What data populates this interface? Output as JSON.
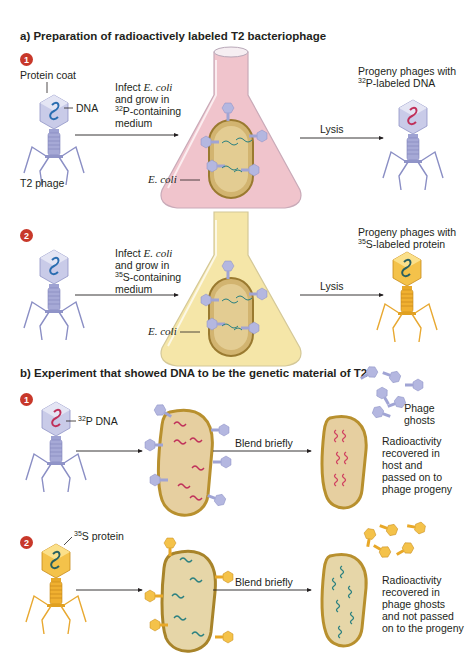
{
  "part_a": {
    "heading": "a) Preparation of radioactively labeled T2 bacteriophage",
    "step1": {
      "number": "1",
      "protein_coat_label": "Protein coat",
      "dna_label": "DNA",
      "phage_label": "T2 phage",
      "infect_line1_prefix": "Infect ",
      "infect_line1_species": "E. coli",
      "infect_line2": "and grow in",
      "infect_line3_isotope": "32",
      "infect_line3_rest": "P-containing",
      "infect_line4": "medium",
      "ecoli_label": "E. coli",
      "lysis_label": "Lysis",
      "progeny_line1": "Progeny phages with",
      "progeny_isotope": "32",
      "progeny_line2_rest": "P-labeled DNA",
      "medium_color": "#f0c4cc",
      "dna_color": "#c0305a"
    },
    "step2": {
      "number": "2",
      "infect_line1_prefix": "Infect ",
      "infect_line1_species": "E. coli",
      "infect_line2": "and grow in",
      "infect_line3_isotope": "35",
      "infect_line3_rest": "S-containing",
      "infect_line4": "medium",
      "ecoli_label": "E. coli",
      "lysis_label": "Lysis",
      "progeny_line1": "Progeny phages with",
      "progeny_isotope": "35",
      "progeny_line2_rest": "S-labeled protein",
      "medium_color": "#f5e6a8",
      "protein_color": "#f0b030"
    }
  },
  "part_b": {
    "heading": "b) Experiment that showed DNA to be the genetic material of T2",
    "step1": {
      "number": "1",
      "label_isotope": "32",
      "label_rest": "P DNA",
      "blend_label": "Blend briefly",
      "ghosts_line1": "Phage",
      "ghosts_line2": "ghosts",
      "result_lines": [
        "Radioactivity",
        "recovered in",
        "host and",
        "passed on to",
        "phage progeny"
      ]
    },
    "step2": {
      "number": "2",
      "label_isotope": "35",
      "label_rest": "S protein",
      "blend_label": "Blend briefly",
      "result_lines": [
        "Radioactivity",
        "recovered in",
        "phage ghosts",
        "and not passed",
        "on to the progeny"
      ]
    }
  },
  "colors": {
    "step_badge": "#c8382a",
    "phage_blue": "#a6a9d6",
    "phage_gold": "#f0b030",
    "cell_fill": "#e6cfa0",
    "cell_border": "#b8902e",
    "dna_blue": "#2a6db0",
    "dna_red": "#c0305a",
    "dna_teal": "#2a8080"
  }
}
